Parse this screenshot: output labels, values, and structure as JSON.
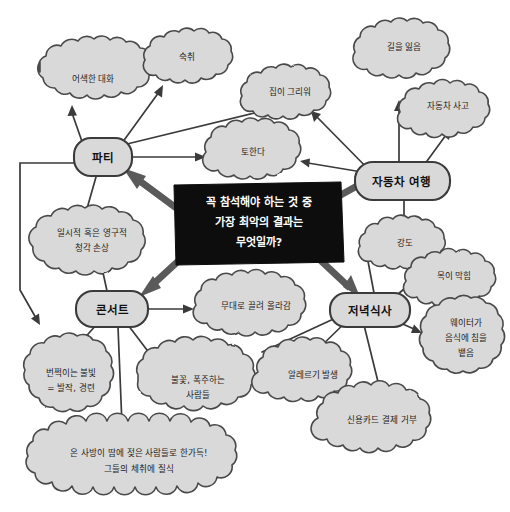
{
  "diagram": {
    "title": "꼭 참석해야 하는 것 중 가장 최악의 결과는 무엇일까?",
    "style": "hand-drawn mind map, Korean handwriting",
    "colors": {
      "cloud_fill": "#d9d9d9",
      "cloud_stroke": "#4a4a4a",
      "center_box_fill": "#0d0d0d",
      "center_box_text": "#ffffff",
      "thick_arrow": "#5a5a5a",
      "background": "#ffffff"
    }
  },
  "center": {
    "name": "central-question",
    "lines": [
      "꼭 참석해야 하는 것 중",
      "가장 최악의 결과는",
      "무엇일까?"
    ]
  },
  "branches": [
    {
      "id": "party",
      "label": "파티",
      "leaves": [
        "어색한 대화",
        "숙취",
        "토한다",
        "일시적 혹은 영구적 청각 손상"
      ]
    },
    {
      "id": "road-trip",
      "label": "자동차 여행",
      "leaves": [
        "집이 그리워",
        "길을 잃음",
        "자동차 사고",
        "강도"
      ]
    },
    {
      "id": "concert",
      "label": "콘서트",
      "leaves": [
        "무대로 끌려 올라감",
        "번쩍이는 불빛 = 발작, 경련",
        "불꽃, 폭주하는 사람들",
        "온 사방이 땀에 젖은 사람들로 한가득! 그들의 체취에 질식"
      ]
    },
    {
      "id": "dinner",
      "label": "저녁식사",
      "leaves": [
        "목이 막힘",
        "웨이터가 음식에 침을 뱉음",
        "알레르기 발생",
        "신용카드 결제 거부"
      ]
    }
  ],
  "nodes": {
    "party": {
      "label": "파티"
    },
    "roadtrip": {
      "label": "자동차 여행"
    },
    "concert": {
      "label": "콘서트"
    },
    "dinner": {
      "label": "저녁식사"
    }
  },
  "clouds": {
    "awkward_talk": {
      "line1": "어색한 대화"
    },
    "hangover": {
      "line1": "숙취"
    },
    "vomit": {
      "line1": "토한다"
    },
    "homesick": {
      "line1": "집이 그리워"
    },
    "lost": {
      "line1": "길을 잃음"
    },
    "car_crash": {
      "line1": "자동차 사고"
    },
    "robbery": {
      "line1": "강도"
    },
    "hearing_damage": {
      "line1": "일시적 혹은 영구적",
      "line2": "청각 손상"
    },
    "dragged_stage": {
      "line1": "무대로 끌려 올라감"
    },
    "flashing_lights": {
      "line1": "번쩍이는 불빛",
      "line2": "= 발작, 경련"
    },
    "fire_riot": {
      "line1": "불꽃, 폭주하는",
      "line2": "사람들"
    },
    "sweaty_crowd": {
      "line1": "온 사방이 땀에 젖은 사람들로 한가득!",
      "line2": "그들의 체취에 질식"
    },
    "choking": {
      "line1": "목이 막힘"
    },
    "waiter_spit": {
      "line1": "웨이터가",
      "line2": "음식에 침을",
      "line3": "뱉음"
    },
    "allergy": {
      "line1": "알레르기 발생"
    },
    "card_declined": {
      "line1": "신용카드 결제 거부"
    }
  }
}
